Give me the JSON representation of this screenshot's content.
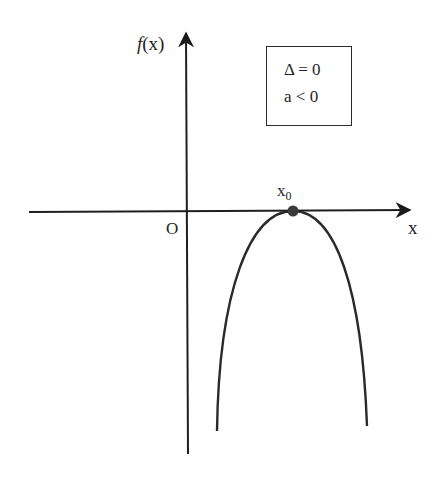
{
  "diagram": {
    "y_axis_label_f": "f",
    "y_axis_label_rest": "(x)",
    "x_axis_label": "x",
    "origin_label": "O",
    "vertex_label_main": "x",
    "vertex_label_sub": "0",
    "legend": {
      "line1": "Δ = 0",
      "line2": "a < 0"
    },
    "colors": {
      "stroke": "#2a2a2a",
      "point": "#3a3a3a",
      "background": "#ffffff"
    }
  }
}
